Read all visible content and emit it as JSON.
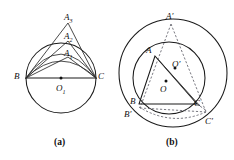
{
  "figure": {
    "type": "geometry-diagram",
    "background_color": "#ffffff",
    "line_color": "#1a1a1a",
    "dashed_line_color": "#55555f",
    "panels": [
      {
        "id": "panel-a",
        "caption": "(a)",
        "description": "Circle with center O1 and chord BC as diameter; nested isosceles triangles BA1C, BA2C, BA3C with apexes A1 inside, A2 on the circle, A3 outside",
        "circle": {
          "cx": 61,
          "cy": 78,
          "r": 35
        },
        "center_label": "O",
        "center_sub": "1",
        "points": [
          {
            "name": "B",
            "label": "B",
            "sub": "",
            "x": 26,
            "y": 78
          },
          {
            "name": "C",
            "label": "C",
            "sub": "",
            "x": 96,
            "y": 78
          },
          {
            "name": "A1",
            "label": "A",
            "sub": "1",
            "x": 68,
            "y": 57
          },
          {
            "name": "A2",
            "label": "A",
            "sub": "2",
            "x": 68,
            "y": 41
          },
          {
            "name": "A3",
            "label": "A",
            "sub": "3",
            "x": 68,
            "y": 23
          },
          {
            "name": "O1",
            "label": "O",
            "sub": "1",
            "x": 61,
            "y": 78
          }
        ]
      },
      {
        "id": "panel-b",
        "caption": "(b)",
        "description": "Two concentric-ish circles: inner circle center O circumscribing triangle ABC, outer circle center O' circumscribing triangle A'B'C'; dashed construction lines from A' to B' and C'",
        "outer_circle": {
          "cx": 173,
          "cy": 73,
          "r": 54
        },
        "inner_circle": {
          "cx": 169,
          "cy": 78,
          "r": 36
        },
        "points": [
          {
            "name": "A",
            "label": "A",
            "prime": "",
            "x": 155,
            "y": 56
          },
          {
            "name": "B",
            "label": "B",
            "prime": "",
            "x": 139,
            "y": 104
          },
          {
            "name": "C",
            "label": "C",
            "prime": "",
            "x": 197,
            "y": 104
          },
          {
            "name": "Aprime",
            "label": "A",
            "prime": "′",
            "x": 171,
            "y": 22
          },
          {
            "name": "Bprime",
            "label": "B",
            "prime": "′",
            "x": 131,
            "y": 113
          },
          {
            "name": "Cprime",
            "label": "C",
            "prime": "′",
            "x": 209,
            "y": 117
          },
          {
            "name": "O",
            "label": "O",
            "prime": "",
            "x": 165,
            "y": 88
          },
          {
            "name": "Oprime",
            "label": "O",
            "prime": "′",
            "x": 176,
            "y": 67
          }
        ]
      }
    ]
  },
  "labels": {
    "panel_a": {
      "B": "B",
      "C": "C",
      "O1_main": "O",
      "O1_sub": "1",
      "A1_main": "A",
      "A1_sub": "1",
      "A2_main": "A",
      "A2_sub": "2",
      "A3_main": "A",
      "A3_sub": "3",
      "caption": "(a)"
    },
    "panel_b": {
      "A": "A",
      "B": "B",
      "C": "C",
      "A_prime": "A′",
      "B_prime": "B′",
      "C_prime": "C′",
      "O": "O",
      "O_prime": "O′",
      "caption": "(b)"
    }
  }
}
